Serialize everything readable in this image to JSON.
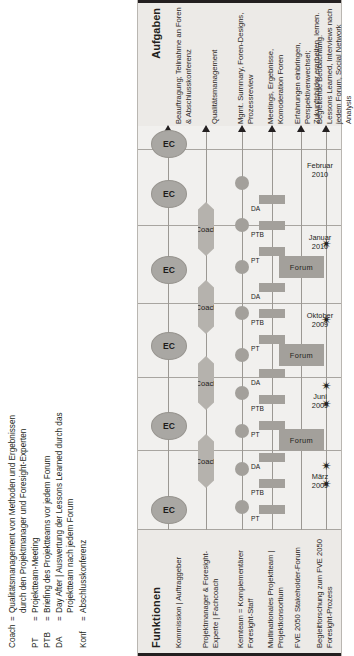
{
  "legend": {
    "rows": [
      {
        "key": "Coach",
        "eq": "=",
        "text": "Qualitätsmanagement von Methoden und Ergebnissen durch den Projektmanager und Foresight-Experten"
      },
      {
        "key": "PT",
        "eq": "=",
        "text": "Projektteam-Meeting"
      },
      {
        "key": "PTB",
        "eq": "=",
        "text": "Briefing des Projektteams vor jedem Forum"
      },
      {
        "key": "DA",
        "eq": "=",
        "text": "Day After | Auswertung der Lessons Learned durch das Projektteam nach jedem Forum"
      },
      {
        "key": "Konf",
        "eq": "=",
        "text": "Abschlusskonferenz"
      }
    ]
  },
  "funktionen": {
    "title": "Funktionen",
    "items": [
      "Kommission | Auftraggeber",
      "Projektmanager & Foresight-Experte | Fachcoach",
      "Kernteam = Komplementärer Foresight-Staff",
      "Multinationales Projektteam | Projektkonsortium",
      "FVE 2050 Stakeholder-Forum",
      "Begleitforschung zum FVE 2050 Foresight-Prozess"
    ]
  },
  "aufgaben": {
    "title": "Aufgaben",
    "items": [
      "Beauftragung; Teilnahme an Foren & Abschlusskonferenz",
      "Qualitätsmanagement",
      "Mgmt. Summary, Foren-Designs, Prozessreview",
      "Meetings, Ergebnisse, Komoderation Foren",
      "Erfahrungen einbringen, Perspektivenwechsel; Zukunftsbilder erarbeiten, lernen.",
      "Begleitende Beobachtung. Lessons Learned, Interviews nach jedem Forum, Social Network Analysis"
    ]
  },
  "timeline": {
    "dates": [
      {
        "month": "März",
        "year": "2009"
      },
      {
        "month": "Juni",
        "year": "2009"
      },
      {
        "month": "Oktober",
        "year": "2009"
      },
      {
        "month": "Januar",
        "year": "2010"
      },
      {
        "month": "Februar",
        "year": "2010"
      }
    ]
  },
  "nodes": {
    "ec_label": "EC",
    "ec_count": 6,
    "coach_label": "Coach",
    "coach_count": 4,
    "forum_label": "Forum",
    "forum_count": 3,
    "blob_count": 9,
    "meeting_labels": [
      "PT",
      "PTB",
      "DA",
      "PT",
      "PTB",
      "DA",
      "PT",
      "PTB",
      "DA",
      "PT",
      "PTB",
      "DA"
    ],
    "star_glyph": "✴",
    "star_count": 6
  },
  "colors": {
    "node_fill": "#a3a09b",
    "panel_bg": "#f1f0ee",
    "header_bg": "#eceae7",
    "rule": "#231f20",
    "lane": "#9b9893"
  }
}
